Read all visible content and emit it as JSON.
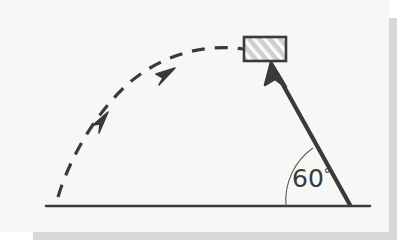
{
  "figure": {
    "kind": "projectile-motion-diagram",
    "title": "",
    "background_color": "#f7f7f5",
    "ink_color": "#3a3a3a",
    "shadow_color": "#d8d8d8",
    "ground": {
      "label": "ground-line",
      "x1": 46,
      "y1": 206,
      "x2": 370,
      "y2": 206,
      "stroke_width": 2.6
    },
    "launch_vector": {
      "label": "launch-velocity-arrow",
      "origin_x": 350,
      "origin_y": 205,
      "tip_x": 271,
      "tip_y": 64,
      "stroke_width": 4.2,
      "style": "solid",
      "arrowhead": "filled"
    },
    "angle": {
      "value": "60",
      "degree_symbol": "°",
      "text": "60°",
      "arc_radius": 66,
      "arc_start_x": 284,
      "arc_start_y": 205,
      "arc_end_x": 312,
      "arc_end_y": 146,
      "arc_stroke_width": 1.1
    },
    "trajectory": {
      "label": "projectile-trajectory",
      "style": "dashed",
      "stroke_width": 3.2,
      "dash_pattern": "13 10",
      "start_x": 58,
      "start_y": 196,
      "apex_x": 215,
      "apex_y": 55,
      "end_x": 243,
      "end_y": 50,
      "arrowheads": [
        {
          "x": 106,
          "y": 116,
          "angle_deg": -52
        },
        {
          "x": 171,
          "y": 71,
          "angle_deg": -24
        }
      ]
    },
    "block": {
      "label": "hatched-block",
      "x": 243,
      "y": 36,
      "width": 43,
      "height": 25,
      "fill": "#cfcfcf",
      "border_color": "#3a3a3a",
      "border_width": 2.4,
      "hatch_color": "#ffffff",
      "hatch_direction": "diagonal"
    }
  }
}
